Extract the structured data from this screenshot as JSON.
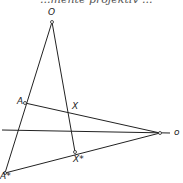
{
  "header_fragment": "...mente projektiv ...",
  "diagram": {
    "labels": {
      "O_top": "O",
      "A": "A",
      "X": "X",
      "A_star": "A*",
      "X_star": "X*",
      "o_axis": "o"
    },
    "points": {
      "O": [
        52,
        22
      ],
      "A": [
        25,
        103
      ],
      "X": [
        70,
        113
      ],
      "A_star": [
        5,
        173
      ],
      "X_star": [
        75,
        152
      ],
      "o": [
        160,
        133
      ]
    },
    "line_color": "#222222"
  }
}
